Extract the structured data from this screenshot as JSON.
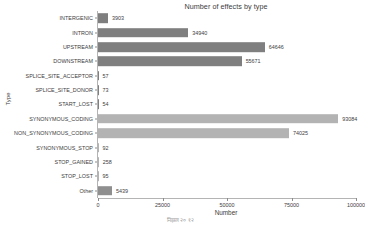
{
  "chart_data": {
    "type": "bar",
    "orientation": "horizontal",
    "title": "Number of effects by type",
    "xlabel": "Number",
    "ylabel": "Type",
    "xlim": [
      0,
      100000
    ],
    "xticks": [
      0,
      25000,
      50000,
      75000,
      100000
    ],
    "xtick_labels": [
      "0",
      "25000",
      "50000",
      "75000",
      "100000"
    ],
    "grid": false,
    "legend": "none",
    "categories": [
      "INTERGENIC",
      "INTRON",
      "UPSTREAM",
      "DOWNSTREAM",
      "SPLICE_SITE_ACCEPTOR",
      "SPLICE_SITE_DONOR",
      "START_LOST",
      "SYNONYMOUS_CODING",
      "NON_SYNONYMOUS_CODING",
      "SYNONYMOUS_STOP",
      "STOP_GAINED",
      "STOP_LOST",
      "Other"
    ],
    "values": [
      3903,
      34940,
      64646,
      55671,
      57,
      73,
      54,
      93084,
      74025,
      92,
      258,
      95,
      5439
    ],
    "value_labels": [
      "3903",
      "34940",
      "64646",
      "55671",
      "57",
      "73",
      "54",
      "93084",
      "74025",
      "92",
      "258",
      "95",
      "5439"
    ],
    "bar_colors": [
      "#7f7f7f",
      "#7f7f7f",
      "#7f7f7f",
      "#7f7f7f",
      "#7f7f7f",
      "#7f7f7f",
      "#7f7f7f",
      "#b3b3b3",
      "#b3b3b3",
      "#b3b3b3",
      "#b3b3b3",
      "#b3b3b3",
      "#8f8f8f"
    ],
    "colors": {
      "axis": "#b4b4b4",
      "tick": "#8c8c8c",
      "text": "#3c3c3c",
      "background": "#ffffff",
      "bar_dark": "#7f7f7f",
      "bar_light": "#b3b3b3"
    }
  },
  "footer": {
    "note": "निझल २०  १२"
  }
}
